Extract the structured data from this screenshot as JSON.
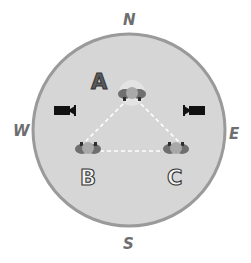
{
  "diagram": {
    "compass": {
      "north": "N",
      "south": "S",
      "east": "E",
      "west": "W"
    },
    "positions": [
      {
        "label": "A",
        "style": "filled"
      },
      {
        "label": "B",
        "style": "outlined"
      },
      {
        "label": "C",
        "style": "outlined"
      }
    ],
    "cameras": [
      {
        "side": "west",
        "icon": "video-camera-icon",
        "facing": "east"
      },
      {
        "side": "east",
        "icon": "video-camera-icon",
        "facing": "west"
      }
    ],
    "connections": [
      [
        "A",
        "B"
      ],
      [
        "B",
        "C"
      ],
      [
        "A",
        "C"
      ]
    ],
    "colors": {
      "field_fill": "#d6d6d6",
      "field_border": "#9a9a9a",
      "dashes": "#ffffff",
      "camera": "#111111",
      "person_body": "#6f6f6f",
      "person_head": "#a9a9a9",
      "letter_a_fill": "#5a5a5a",
      "letter_outline": "#333333"
    }
  }
}
